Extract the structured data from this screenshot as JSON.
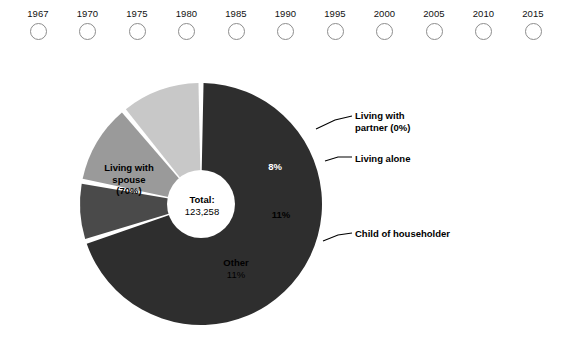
{
  "year_selector": {
    "name": "year-selector",
    "options": [
      {
        "label": "1967",
        "selected": false
      },
      {
        "label": "1970",
        "selected": false
      },
      {
        "label": "1975",
        "selected": false
      },
      {
        "label": "1980",
        "selected": false
      },
      {
        "label": "1985",
        "selected": false
      },
      {
        "label": "1990",
        "selected": false
      },
      {
        "label": "1995",
        "selected": false
      },
      {
        "label": "2000",
        "selected": false
      },
      {
        "label": "2005",
        "selected": false
      },
      {
        "label": "2010",
        "selected": false
      },
      {
        "label": "2015",
        "selected": false
      }
    ]
  },
  "hub": {
    "title": "Total:",
    "value": "123,258"
  },
  "slice_labels": {
    "spouse": "Living with spouse (70%)",
    "spouse_line1": "Living with",
    "spouse_line2": "spouse",
    "spouse_line3": "(70%)",
    "alone_pct": "8%",
    "child_pct": "11%",
    "other_name": "Other",
    "other_pct": "11%"
  },
  "callouts": {
    "partner_line1": "Living with",
    "partner_line2": "partner (0%)",
    "alone": "Living alone",
    "child": "Child of householder"
  },
  "colors": {
    "spouse": "#2e2e2e",
    "partner": "#ffffff",
    "alone": "#4a4a4a",
    "child": "#9a9a9a",
    "other": "#c8c8c8",
    "hub": "#ffffff",
    "separator": "#ffffff",
    "leader_line": "#000000",
    "radio_stroke": "#8d8d8d",
    "background": "#ffffff"
  },
  "chart_data": {
    "type": "pie",
    "title": "",
    "subtitle": "",
    "xlabel": "",
    "ylabel": "",
    "donut": true,
    "inner_radius_ratio": 0.28,
    "total_label": "Total:",
    "total_value": "123,258",
    "total_value_numeric": 123258,
    "units": "thousands of people",
    "legend": "annotated-callouts",
    "grid": false,
    "categories": [
      "Living with spouse",
      "Living with partner",
      "Living alone",
      "Child of householder",
      "Other"
    ],
    "values": [
      70,
      0,
      8,
      11,
      11
    ],
    "value_labels": [
      "(70%)",
      "(0%)",
      "8%",
      "11%",
      "11%"
    ],
    "slice_colors": [
      "#2e2e2e",
      "#ffffff",
      "#4a4a4a",
      "#9a9a9a",
      "#c8c8c8"
    ],
    "label_placement": [
      "inside",
      "callout",
      "inside+callout",
      "inside+callout",
      "inside"
    ],
    "start_angle_deg": -90,
    "direction": "clockwise",
    "series": [
      {
        "name": "Living arrangements",
        "values": [
          70,
          0,
          8,
          11,
          11
        ]
      }
    ]
  }
}
